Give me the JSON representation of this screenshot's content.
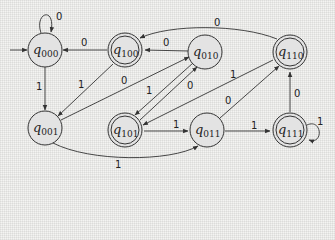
{
  "diagram": {
    "type": "finite-automaton",
    "start_state": "q000",
    "states": [
      {
        "id": "q000",
        "name": "q",
        "sub": "000",
        "x": 45,
        "y": 50,
        "accepting": false
      },
      {
        "id": "q100",
        "name": "q",
        "sub": "100",
        "x": 125,
        "y": 50,
        "accepting": true
      },
      {
        "id": "q010",
        "name": "q",
        "sub": "010",
        "x": 205,
        "y": 52,
        "accepting": false
      },
      {
        "id": "q110",
        "name": "q",
        "sub": "110",
        "x": 290,
        "y": 52,
        "accepting": true
      },
      {
        "id": "q001",
        "name": "q",
        "sub": "001",
        "x": 45,
        "y": 128,
        "accepting": false
      },
      {
        "id": "q101",
        "name": "q",
        "sub": "101",
        "x": 125,
        "y": 130,
        "accepting": true
      },
      {
        "id": "q011",
        "name": "q",
        "sub": "011",
        "x": 207,
        "y": 130,
        "accepting": false
      },
      {
        "id": "q111",
        "name": "q",
        "sub": "111",
        "x": 290,
        "y": 130,
        "accepting": true
      }
    ],
    "transitions": [
      {
        "from": "q000",
        "to": "q000",
        "label": "0"
      },
      {
        "from": "q100",
        "to": "q000",
        "label": "0"
      },
      {
        "from": "q010",
        "to": "q100",
        "label": "0"
      },
      {
        "from": "q110",
        "to": "q100",
        "label": "0"
      },
      {
        "from": "q000",
        "to": "q001",
        "label": "1"
      },
      {
        "from": "q100",
        "to": "q001",
        "label": "1"
      },
      {
        "from": "q001",
        "to": "q010",
        "label": "0"
      },
      {
        "from": "q010",
        "to": "q101",
        "label": "1"
      },
      {
        "from": "q101",
        "to": "q010",
        "label": "0"
      },
      {
        "from": "q110",
        "to": "q101",
        "label": "1"
      },
      {
        "from": "q011",
        "to": "q110",
        "label": "0"
      },
      {
        "from": "q101",
        "to": "q011",
        "label": "1"
      },
      {
        "from": "q001",
        "to": "q011",
        "label": "1"
      },
      {
        "from": "q011",
        "to": "q111",
        "label": "1"
      },
      {
        "from": "q111",
        "to": "q110",
        "label": "0"
      },
      {
        "from": "q111",
        "to": "q111",
        "label": "1"
      }
    ]
  },
  "labels": {
    "q000": {
      "n": "q",
      "s": "000"
    },
    "q100": {
      "n": "q",
      "s": "100"
    },
    "q010": {
      "n": "q",
      "s": "010"
    },
    "q110": {
      "n": "q",
      "s": "110"
    },
    "q001": {
      "n": "q",
      "s": "001"
    },
    "q101": {
      "n": "q",
      "s": "101"
    },
    "q011": {
      "n": "q",
      "s": "011"
    },
    "q111": {
      "n": "q",
      "s": "111"
    },
    "e": [
      "0",
      "0",
      "0",
      "0",
      "1",
      "1",
      "0",
      "1",
      "0",
      "1",
      "0",
      "1",
      "1",
      "1",
      "0",
      "1"
    ]
  }
}
